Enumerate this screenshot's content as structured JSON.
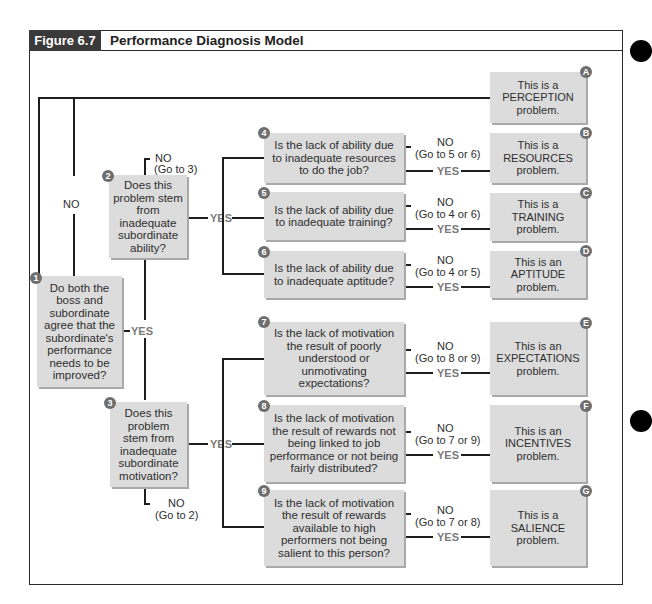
{
  "header": {
    "figure_label": "Figure 6.7",
    "title": "Performance Diagnosis Model"
  },
  "questions": [
    {
      "number": "1",
      "text": "Do both the boss and subordinate agree that the subordinate's performance needs to be improved?"
    },
    {
      "number": "2",
      "text": "Does this problem stem from inadequate subordinate ability?"
    },
    {
      "number": "3",
      "text": "Does this problem stem from inadequate subordinate motivation?"
    },
    {
      "number": "4",
      "text": "Is the lack of ability due to inadequate resources to do the job?"
    },
    {
      "number": "5",
      "text": "Is the lack of ability due to inadequate training?"
    },
    {
      "number": "6",
      "text": "Is the lack of ability due to inadequate aptitude?"
    },
    {
      "number": "7",
      "text": "Is the lack of motivation the result of poorly understood or unmotivating expectations?"
    },
    {
      "number": "8",
      "text": "Is the lack of motivation the result of rewards not being linked to job performance or not being fairly distributed?"
    },
    {
      "number": "9",
      "text": "Is the lack of motivation the result of rewards available to high performers not being salient to this person?"
    }
  ],
  "results": [
    {
      "letter": "A",
      "line1": "This is a",
      "line2": "PERCEPTION",
      "line3": "problem."
    },
    {
      "letter": "B",
      "line1": "This is a",
      "line2": "RESOURCES",
      "line3": "problem."
    },
    {
      "letter": "C",
      "line1": "This is a",
      "line2": "TRAINING",
      "line3": "problem."
    },
    {
      "letter": "D",
      "line1": "This is an",
      "line2": "APTITUDE",
      "line3": "problem."
    },
    {
      "letter": "E",
      "line1": "This is an",
      "line2": "EXPECTATIONS",
      "line3": "problem."
    },
    {
      "letter": "F",
      "line1": "This is an",
      "line2": "INCENTIVES",
      "line3": "problem."
    },
    {
      "letter": "G",
      "line1": "This is a",
      "line2": "SALIENCE",
      "line3": "problem."
    }
  ],
  "labels": {
    "no": "NO",
    "yes": "YES",
    "q2_no_goto": "(Go to 3)",
    "q3_no_goto": "(Go to 2)",
    "q4_no_goto": "(Go to 5 or 6)",
    "q5_no_goto": "(Go to 4 or 6)",
    "q6_no_goto": "(Go to 4 or 5)",
    "q7_no_goto": "(Go to 8 or 9)",
    "q8_no_goto": "(Go to 7 or 9)",
    "q9_no_goto": "(Go to 7 or 8)"
  }
}
